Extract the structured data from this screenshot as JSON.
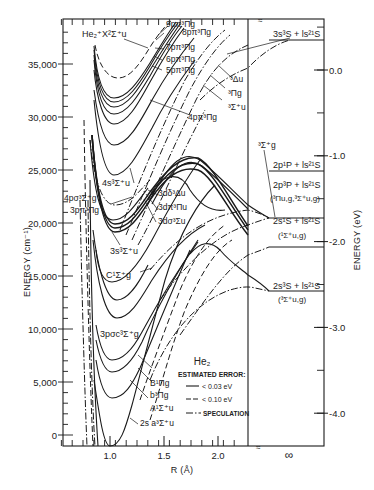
{
  "chart_data": {
    "type": "line",
    "xlabel": "R (Å)",
    "ylabel_left": "ENERGY (cm⁻¹)",
    "ylabel_right": "ENERGY (eV)",
    "xlim": [
      0.5,
      2.27
    ],
    "ylim": [
      -500,
      38500
    ],
    "x_ticks": [
      {
        "v": 1.0,
        "label": "1.0"
      },
      {
        "v": 1.5,
        "label": "1.5"
      },
      {
        "v": 2.0,
        "label": "2.0"
      }
    ],
    "x_infinity_label": "∞",
    "x_break_mark": "≈",
    "y_ticks_left": [
      {
        "v": 0,
        "label": "0"
      },
      {
        "v": 5000,
        "label": "5,000"
      },
      {
        "v": 10000,
        "label": "10,000"
      },
      {
        "v": 15000,
        "label": "15,000"
      },
      {
        "v": 20000,
        "label": "20,000"
      },
      {
        "v": 25000,
        "label": "25,000"
      },
      {
        "v": 30000,
        "label": "30,000"
      },
      {
        "v": 35000,
        "label": "35,000"
      }
    ],
    "y_ticks_right_eV": [
      {
        "v": 0.0,
        "label": "0.0"
      },
      {
        "v": -1.0,
        "label": "-1.0"
      },
      {
        "v": -2.0,
        "label": "-2.0"
      },
      {
        "v": -3.0,
        "label": "-3.0"
      },
      {
        "v": -4.0,
        "label": "-4.0"
      }
    ],
    "legend": {
      "title": "ESTIMATED ERROR:",
      "entries": [
        {
          "style": "solid",
          "label": "< 0.03 eV"
        },
        {
          "style": "dashed",
          "label": "< 0.10 eV"
        },
        {
          "style": "dashdot",
          "label": "SPECULATION"
        }
      ]
    },
    "asymptotes": [
      {
        "label": "3s³S + ls² ¹S",
        "E": 37300
      },
      {
        "label": "2p¹P + ls² ¹S",
        "E": 24500
      },
      {
        "label": "2p³P + ls² ¹S",
        "E": 21300,
        "sublabel": "(³Πu,g, ³Σ⁺u,g)"
      },
      {
        "label": "2s¹S + ls² ¹S",
        "E": 15900,
        "sublabel": "(¹Σ⁺u,g)"
      },
      {
        "label": "2s³S + ls² ¹S",
        "E": 11300,
        "sublabel": "(³Σ⁺u,g)"
      }
    ],
    "series": [
      {
        "name": "2s a³Σ⁺u",
        "style": "solid",
        "Re": 1.05,
        "Te": 0,
        "note": "ground triplet"
      },
      {
        "name": "A¹Σ⁺u",
        "style": "solid",
        "Re": 1.04,
        "Te": 3700
      },
      {
        "name": "b³Πg",
        "style": "solid",
        "Re": 1.07,
        "Te": 6300
      },
      {
        "name": "B¹Πg",
        "style": "solid",
        "Re": 1.07,
        "Te": 7400
      },
      {
        "name": "3pσ c³Σ⁺g",
        "style": "solid",
        "Re": 1.1,
        "Te": 16700
      },
      {
        "name": "C¹Σ⁺g",
        "style": "solid",
        "Re": 1.09,
        "Te": 19900
      },
      {
        "name": "3s³Σ⁺u",
        "style": "solid",
        "Re": 1.07,
        "Te": 24000
      },
      {
        "name": "3dσ³Σu",
        "style": "solid",
        "Re": 1.07,
        "Te": 24900
      },
      {
        "name": "3dπ³Πu",
        "style": "solid",
        "Re": 1.07,
        "Te": 25300
      },
      {
        "name": "3dδ³Δu",
        "style": "solid",
        "Re": 1.07,
        "Te": 25600
      },
      {
        "name": "3pπ³Πg",
        "style": "solid",
        "Re": 1.07,
        "Te": 25100
      },
      {
        "name": "4pσ³Σ⁺g",
        "style": "dashdot",
        "Re": 1.05,
        "Te": 27600
      },
      {
        "name": "4s³Σ⁺u",
        "style": "solid",
        "Re": 1.07,
        "Te": 29600
      },
      {
        "name": "4pπ³Πg",
        "style": "solid",
        "Re": 1.07,
        "Te": 32500
      },
      {
        "name": "5pπ³Πg",
        "style": "solid",
        "Re": 1.07,
        "Te": 34100
      },
      {
        "name": "6pπ³Πg",
        "style": "solid",
        "Re": 1.07,
        "Te": 34800
      },
      {
        "name": "7pπ³Πg",
        "style": "solid",
        "Re": 1.07,
        "Te": 35300
      },
      {
        "name": "8pπ³Πg",
        "style": "solid",
        "Re": 1.07,
        "Te": 35700
      },
      {
        "name": "9pπ³Πg",
        "style": "solid",
        "Re": 1.07,
        "Te": 36000
      },
      {
        "name": "He₂⁺ X²Σ⁺u",
        "style": "dashed",
        "Re": 1.08,
        "Te": 37400
      },
      {
        "name": "³Σ⁺g",
        "style": "dashdot",
        "note": "repulsive hump correlating to 2p"
      },
      {
        "name": "³Δu",
        "style": "dashdot"
      },
      {
        "name": "³Πg",
        "style": "dashdot"
      },
      {
        "name": "³Σ⁺u",
        "style": "dashdot"
      }
    ]
  },
  "labels": {
    "ion": "He₂⁺X²Σ⁺u",
    "l9": "9pπ³Πg",
    "l8": "8pπ³Πg",
    "l7": "7pπ³Πg",
    "l6": "6pπ³Πg",
    "l5": "5pπ³Πg",
    "l4p": "4pπ³Πg",
    "d3": "³Δu",
    "p3": "³Πg",
    "s3u": "³Σ⁺u",
    "s4": "4s³Σ⁺u",
    "p4s": "4pσ³Σ⁺g",
    "p3pi": "3pπ³Πg",
    "d3d": "3dδ³Δu",
    "d3p": "3dπ³Πu",
    "d3s": "3dσ³Σu",
    "s3": "3s³Σ⁺u",
    "C": "C¹Σ⁺g",
    "c": "3pσc³Σ⁺g",
    "B": "B¹Πg",
    "b": "b³Πg",
    "A": "A¹Σ⁺u",
    "a": "2s a³Σ⁺u",
    "s3g": "³Σ⁺g",
    "as1": "3s³S + ls²¹S",
    "as2": "2p¹P + ls²¹S",
    "as3": "2p³P + ls²¹S",
    "as3b": "(³Πu,g,³Σ⁺u,g)",
    "as4": "2s¹S + ls²¹S",
    "as4b": "(¹Σ⁺u,g)",
    "as5": "2s³S + ls²¹S",
    "as5b": "(³Σ⁺u,g)",
    "he2": "He₂",
    "err": "ESTIMATED ERROR:",
    "e1": "< 0.03 eV",
    "e2": "< 0.10 eV",
    "e3": "SPECULATION",
    "ylabL": "ENERGY (cm⁻¹)",
    "ylabR": "ENERGY (eV)",
    "xlab": "R (Å)",
    "inf": "∞"
  }
}
